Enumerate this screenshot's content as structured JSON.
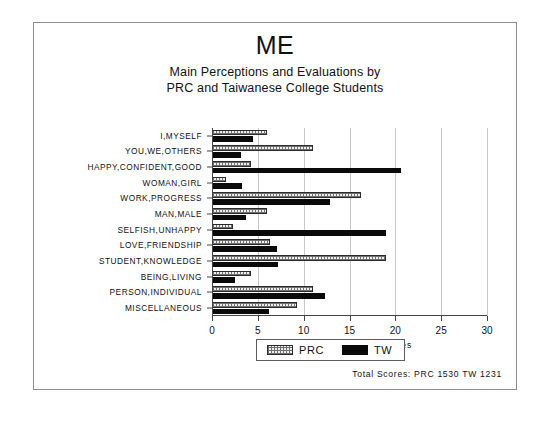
{
  "figure": {
    "title": "ME",
    "subtitle_line1": "Main Perceptions and Evaluations by",
    "subtitle_line2": "PRC and Taiwanese College Students",
    "footer_note": "Total Scores:  PRC 1530   TW 1231"
  },
  "legend": {
    "position": "bottom-center",
    "items": [
      {
        "label": "PRC",
        "swatch": "hatched-light-swatch",
        "color": "#efefef"
      },
      {
        "label": "TW",
        "swatch": "solid-black-swatch",
        "color": "#0a0a0a"
      }
    ]
  },
  "axis": {
    "xlabel": "Percentage of Total Scores",
    "ticks": [
      "0",
      "5",
      "10",
      "15",
      "20",
      "25",
      "30"
    ]
  },
  "chart_data": {
    "type": "bar",
    "orientation": "horizontal",
    "title": "ME",
    "subtitle": "Main Perceptions and Evaluations by PRC and Taiwanese College Students",
    "xlabel": "Percentage of Total Scores",
    "ylabel": "",
    "xlim": [
      0,
      30
    ],
    "xticks": [
      0,
      5,
      10,
      15,
      20,
      25,
      30
    ],
    "grid": true,
    "legend_position": "bottom-center",
    "categories": [
      "I,MYSELF",
      "YOU,WE,OTHERS",
      "HAPPY,CONFIDENT,GOOD",
      "WOMAN,GIRL",
      "WORK,PROGRESS",
      "MAN,MALE",
      "SELFISH,UNHAPPY",
      "LOVE,FRIENDSHIP",
      "STUDENT,KNOWLEDGE",
      "BEING,LIVING",
      "PERSON,INDIVIDUAL",
      "MISCELLANEOUS"
    ],
    "series": [
      {
        "name": "PRC",
        "color": "#efefef",
        "values": [
          6.0,
          11.0,
          4.2,
          1.5,
          16.2,
          6.0,
          2.3,
          6.3,
          19.0,
          4.3,
          11.0,
          9.3
        ]
      },
      {
        "name": "TW",
        "color": "#0a0a0a",
        "values": [
          4.5,
          3.2,
          20.6,
          3.3,
          12.9,
          3.7,
          19.0,
          7.1,
          7.2,
          2.5,
          12.3,
          6.2
        ]
      }
    ],
    "annotations": [
      "Total Scores:  PRC 1530   TW 1231"
    ]
  }
}
